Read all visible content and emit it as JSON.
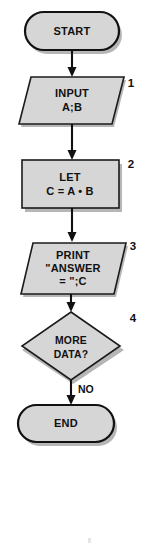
{
  "diagram": {
    "type": "flowchart",
    "background_color": "#ffffff",
    "shape_fill_color": "#d6d6d6",
    "shape_outline_color": "#111111",
    "connector_color": "#111111",
    "nodes": [
      {
        "id": "start",
        "shape": "terminal",
        "step_number": "",
        "lines": [
          "START"
        ],
        "line1": "START",
        "line2": "",
        "line3": ""
      },
      {
        "id": "input",
        "shape": "input-output",
        "step_number": "1",
        "lines": [
          "INPUT",
          "A;B"
        ],
        "line1": "INPUT",
        "line2": "A;B",
        "line3": ""
      },
      {
        "id": "let",
        "shape": "process",
        "step_number": "2",
        "lines": [
          "LET",
          "C = A • B"
        ],
        "line1": "LET",
        "line2": "C = A • B",
        "line3": ""
      },
      {
        "id": "print",
        "shape": "input-output",
        "step_number": "3",
        "lines": [
          "PRINT",
          "\"ANSWER",
          "= \";C"
        ],
        "line1": "PRINT",
        "line2": "\"ANSWER",
        "line3": "= \";C"
      },
      {
        "id": "decision",
        "shape": "decision",
        "step_number": "4",
        "lines": [
          "MORE",
          "DATA?"
        ],
        "line1": "MORE",
        "line2": "DATA?",
        "line3": ""
      },
      {
        "id": "end",
        "shape": "terminal",
        "step_number": "",
        "lines": [
          "END"
        ],
        "line1": "END",
        "line2": "",
        "line3": ""
      }
    ],
    "connectors": [
      {
        "id": "start-to-input",
        "from": "start",
        "to": "input",
        "label": ""
      },
      {
        "id": "input-to-let",
        "from": "input",
        "to": "let",
        "label": ""
      },
      {
        "id": "let-to-print",
        "from": "let",
        "to": "print",
        "label": ""
      },
      {
        "id": "print-to-decision",
        "from": "print",
        "to": "decision",
        "label": ""
      },
      {
        "id": "decision-to-end",
        "from": "decision",
        "to": "end",
        "label": "NO"
      }
    ]
  }
}
